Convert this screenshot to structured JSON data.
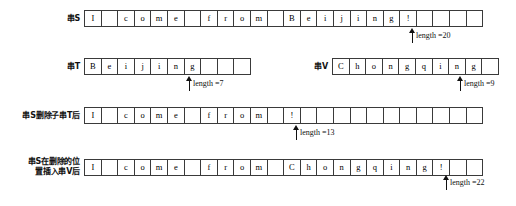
{
  "figure": {
    "rows": [
      {
        "id": "string-s",
        "label": "串S",
        "label_lines": [
          "串S"
        ],
        "cells": [
          "I",
          "",
          "c",
          "o",
          "m",
          "e",
          "",
          "f",
          "r",
          "o",
          "m",
          "",
          "B",
          "e",
          "i",
          "j",
          "i",
          "n",
          "g",
          "!",
          "",
          "",
          "",
          ""
        ],
        "total_cells": 24,
        "length_text": "length =20",
        "length_value": 20,
        "arrow_cell_index": 19
      },
      {
        "id": "string-t",
        "label": "串T",
        "label_lines": [
          "串T"
        ],
        "cells": [
          "B",
          "e",
          "i",
          "j",
          "i",
          "n",
          "g",
          "",
          "",
          ""
        ],
        "total_cells": 10,
        "length_text": "length =7",
        "length_value": 7,
        "arrow_cell_index": 6
      },
      {
        "id": "string-v",
        "label": "串V",
        "label_lines": [
          "串V"
        ],
        "cells": [
          "C",
          "h",
          "o",
          "n",
          "g",
          "q",
          "i",
          "n",
          "g",
          ""
        ],
        "total_cells": 10,
        "length_text": "length =9",
        "length_value": 9,
        "arrow_cell_index": 8
      },
      {
        "id": "string-s-after-delete",
        "label": "串S删除子串T后",
        "label_lines": [
          "串S删除子串T后"
        ],
        "cells": [
          "I",
          "",
          "c",
          "o",
          "m",
          "e",
          "",
          "f",
          "r",
          "o",
          "m",
          "",
          "!",
          "",
          "",
          "",
          "",
          "",
          "",
          "",
          "",
          "",
          "",
          ""
        ],
        "total_cells": 24,
        "length_text": "length =13",
        "length_value": 13,
        "arrow_cell_index": 12
      },
      {
        "id": "string-s-after-insert",
        "label": "串S在删除的位置插入串V后",
        "label_lines": [
          "串S在删除的位",
          "置插入串V后"
        ],
        "cells": [
          "I",
          "",
          "c",
          "o",
          "m",
          "e",
          "",
          "f",
          "r",
          "o",
          "m",
          "",
          "C",
          "h",
          "o",
          "n",
          "g",
          "q",
          "i",
          "n",
          "g",
          "!",
          "",
          ""
        ],
        "total_cells": 24,
        "length_text": "length =22",
        "length_value": 22,
        "arrow_cell_index": 21
      }
    ],
    "colors": {
      "background": "#ffffff",
      "border": "#3a3a3a",
      "text": "#111111"
    }
  }
}
